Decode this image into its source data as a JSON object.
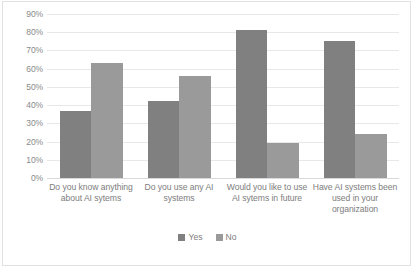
{
  "chart_data": {
    "type": "bar",
    "title": "",
    "subtitle": "",
    "xlabel": "",
    "ylabel": "",
    "ylim": [
      0,
      90
    ],
    "ytick_labels": [
      "0%",
      "10%",
      "20%",
      "30%",
      "40%",
      "50%",
      "60%",
      "70%",
      "80%",
      "90%"
    ],
    "ytick_values": [
      0,
      10,
      20,
      30,
      40,
      50,
      60,
      70,
      80,
      90
    ],
    "grid": true,
    "legend_position": "bottom",
    "categories": [
      "Do you know anything about AI sytems",
      "Do you use any AI systems",
      "Would you like to use AI sytems in future",
      "Have AI systems been used in your organization"
    ],
    "series": [
      {
        "name": "Yes",
        "color": "#808080",
        "values": [
          37,
          42,
          81,
          75
        ]
      },
      {
        "name": "No",
        "color": "#9a9a9a",
        "values": [
          63,
          56,
          19,
          24
        ]
      }
    ]
  },
  "legend": {
    "items": [
      {
        "label": "Yes",
        "color": "#808080"
      },
      {
        "label": "No",
        "color": "#9a9a9a"
      }
    ]
  },
  "colors": {
    "gridline": "#e8e8e8",
    "axis_text": "#8a8a8a",
    "label_text": "#7d7d7d",
    "frame": "#e2e2e2",
    "background": "#ffffff"
  }
}
